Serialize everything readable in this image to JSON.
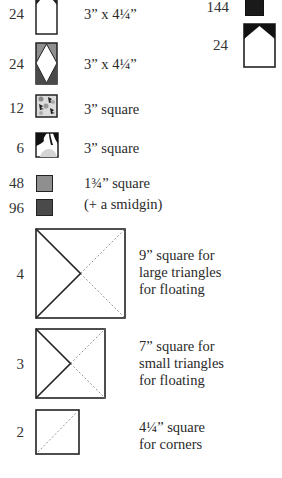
{
  "colors": {
    "ink": "#222222",
    "medium_gray": "#8f8f8f",
    "dark_gray": "#4a4a4a",
    "light_gray": "#c9c9c9",
    "dashed_line": "#999999"
  },
  "left_column": [
    {
      "qty": "24",
      "icon": "house-block-icon",
      "desc": "3” x 4¼”"
    },
    {
      "qty": "24",
      "icon": "diamond-block-icon",
      "desc": "3” x 4¼”"
    },
    {
      "qty": "12",
      "icon": "print-fabric-square-icon",
      "desc": "3” square"
    },
    {
      "qty": "6",
      "icon": "print-fabric-square-2-icon",
      "desc": "3” square"
    },
    {
      "qty": "48",
      "icon": "medium-gray-square-icon",
      "desc": "1¾” square"
    },
    {
      "qty": "96",
      "icon": "dark-gray-square-icon",
      "desc": "(+ a smidgin)"
    },
    {
      "qty": "4",
      "icon": "large-triangle-square-icon",
      "desc_lines": [
        "9” square for",
        "large triangles",
        "for floating"
      ]
    },
    {
      "qty": "3",
      "icon": "small-triangle-square-icon",
      "desc_lines": [
        "7” square for",
        "small triangles",
        "for floating"
      ]
    },
    {
      "qty": "2",
      "icon": "corner-square-icon",
      "desc_lines": [
        "4¼” square",
        "for corners"
      ]
    }
  ],
  "right_column": [
    {
      "qty": "144",
      "icon": "black-square-icon"
    },
    {
      "qty": "24",
      "icon": "black-house-block-icon"
    }
  ]
}
